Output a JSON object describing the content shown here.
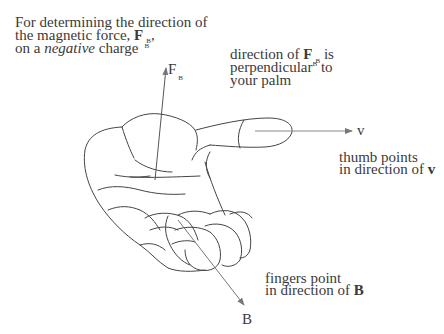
{
  "title": {
    "line1": "For determining the direction of",
    "line2_prefix": "the magnetic force, ",
    "line2_symbol": "F",
    "line2_sub": "B",
    "line2_suffix": ",",
    "line3_prefix": "on a ",
    "line3_italic": "negative",
    "line3_suffix": " charge",
    "line3_sub": "B"
  },
  "annotations": {
    "force": {
      "prefix": "direction of ",
      "symbol": "F",
      "sub": "B",
      "line1_suffix": " is",
      "line2": "perpendicular",
      "line2_sub": "B",
      "line2_suffix": " to",
      "line3": "your palm"
    },
    "thumb": {
      "line1": "thumb points",
      "line2_prefix": "in direction of ",
      "line2_symbol": "v"
    },
    "fingers": {
      "line1": "fingers point",
      "line2_prefix": "in direction of ",
      "line2_symbol": "B"
    }
  },
  "vectors": {
    "force_label": "F",
    "force_sub": "B",
    "velocity_label": "v",
    "field_label": "B"
  },
  "colors": {
    "ink": "#3a3a3a",
    "arrow": "#777777"
  }
}
